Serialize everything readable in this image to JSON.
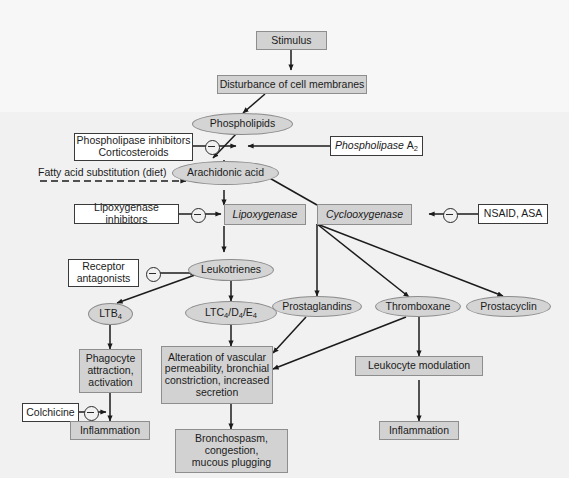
{
  "figure": {
    "colors": {
      "background": "#f1f1f1",
      "gray_box": "#d2d2d2",
      "ellipse": "#d4d4d4",
      "white_box": "#ffffff",
      "line": "#1b1b1b"
    }
  },
  "nodes": {
    "stimulus": "Stimulus",
    "disturbance": "Disturbance of cell membranes",
    "phospholipids": "Phospholipids",
    "phospholipase_inhibitors": "Phospholipase inhibitors\nCorticosteroids",
    "phospholipase_inhibitors_l1": "Phospholipase inhibitors",
    "phospholipase_inhibitors_l2": "Corticosteroids",
    "phospholipase_a2_pre": "Phospholipase",
    "phospholipase_a2_sub": "A",
    "phospholipase_a2_num": "2",
    "fatty_acid": "Fatty acid substitution (diet)",
    "arachidonic": "Arachidonic acid",
    "lipoxygenase_inhibitors": "Lipoxygenase inhibitors",
    "lipoxygenase": "Lipoxygenase",
    "cyclooxygenase": "Cyclooxygenase",
    "nsaid": "NSAID, ASA",
    "receptor_antagonists_l1": "Receptor",
    "receptor_antagonists_l2": "antagonists",
    "leukotrienes": "Leukotrienes",
    "ltb4_pre": "LTB",
    "ltb4_sub": "4",
    "ltc4_seq": "LTC4/D4/E4",
    "prostaglandins": "Prostaglandins",
    "thromboxane": "Thromboxane",
    "prostacyclin": "Prostacyclin",
    "phagocyte_l1": "Phagocyte",
    "phagocyte_l2": "attraction,",
    "phagocyte_l3": "activation",
    "colchicine": "Colchicine",
    "inflammation_left": "Inflammation",
    "alteration_l1": "Alteration of vascular",
    "alteration_l2": "permeability, bronchial",
    "alteration_l3": "constriction, increased",
    "alteration_l4": "secretion",
    "bronchospasm_l1": "Bronchospasm,",
    "bronchospasm_l2": "congestion,",
    "bronchospasm_l3": "mucous plugging",
    "leukocyte_modulation": "Leukocyte modulation",
    "inflammation_right": "Inflammation"
  },
  "edges": [
    {
      "from": "stimulus",
      "to": "disturbance",
      "style": "solid"
    },
    {
      "from": "disturbance",
      "to": "phospholipids",
      "style": "solid"
    },
    {
      "from": "phospholipids",
      "to": "arachidonic",
      "style": "solid"
    },
    {
      "from": "phospholipase_inhibitors",
      "to": "phospholipids-arachidonic",
      "style": "inhibit"
    },
    {
      "from": "phospholipase_a2",
      "to": "phospholipids-arachidonic",
      "style": "solid"
    },
    {
      "from": "fatty_acid",
      "to": "arachidonic",
      "style": "dashed"
    },
    {
      "from": "arachidonic",
      "to": "lipoxygenase",
      "style": "solid"
    },
    {
      "from": "arachidonic",
      "to": "cyclooxygenase",
      "style": "solid"
    },
    {
      "from": "lipoxygenase_inhibitors",
      "to": "lipoxygenase",
      "style": "inhibit"
    },
    {
      "from": "nsaid",
      "to": "cyclooxygenase",
      "style": "inhibit"
    },
    {
      "from": "lipoxygenase",
      "to": "leukotrienes",
      "style": "solid"
    },
    {
      "from": "leukotrienes",
      "to": "ltb4",
      "style": "solid"
    },
    {
      "from": "leukotrienes",
      "to": "ltc4",
      "style": "solid"
    },
    {
      "from": "receptor_antagonists",
      "to": "leukotrienes",
      "style": "inhibit"
    },
    {
      "from": "cyclooxygenase",
      "to": "prostaglandins",
      "style": "solid"
    },
    {
      "from": "cyclooxygenase",
      "to": "thromboxane",
      "style": "solid"
    },
    {
      "from": "cyclooxygenase",
      "to": "prostacyclin",
      "style": "solid"
    },
    {
      "from": "ltb4",
      "to": "phagocyte",
      "style": "solid"
    },
    {
      "from": "ltc4",
      "to": "alteration",
      "style": "solid"
    },
    {
      "from": "prostaglandins",
      "to": "alteration",
      "style": "solid"
    },
    {
      "from": "thromboxane",
      "to": "alteration",
      "style": "solid"
    },
    {
      "from": "thromboxane",
      "to": "leukocyte_modulation",
      "style": "solid"
    },
    {
      "from": "phagocyte",
      "to": "inflammation_left",
      "style": "solid"
    },
    {
      "from": "colchicine",
      "to": "phagocyte-inflammation",
      "style": "inhibit"
    },
    {
      "from": "alteration",
      "to": "bronchospasm",
      "style": "solid"
    },
    {
      "from": "leukocyte_modulation",
      "to": "inflammation_right",
      "style": "solid"
    }
  ]
}
